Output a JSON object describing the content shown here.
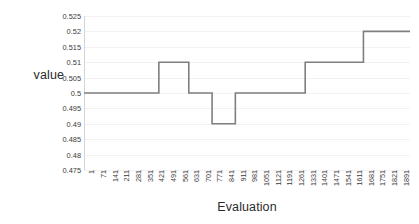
{
  "chart_data": {
    "type": "line",
    "subtype": "step",
    "title": "",
    "xlabel": "Evaluation",
    "ylabel": "value",
    "ylim": [
      0.475,
      0.525
    ],
    "xlim": [
      1,
      1961
    ],
    "grid": true,
    "legend": false,
    "y_ticks": [
      0.525,
      0.52,
      0.515,
      0.51,
      0.505,
      0.5,
      0.495,
      0.49,
      0.485,
      0.48,
      0.475
    ],
    "y_tick_labels": [
      "0.525",
      "0.52",
      "0.515",
      "0.51",
      "0.505",
      "0.5",
      "0.495",
      "0.49",
      "0.485",
      "0.48",
      "0.475"
    ],
    "x_ticks": [
      1,
      71,
      141,
      211,
      281,
      351,
      421,
      491,
      561,
      631,
      701,
      771,
      841,
      911,
      981,
      1051,
      1121,
      1191,
      1261,
      1331,
      1401,
      1471,
      1541,
      1611,
      1681,
      1751,
      1821,
      1891
    ],
    "x_tick_labels": [
      "1",
      "71",
      "141",
      "211",
      "281",
      "351",
      "421",
      "491",
      "561",
      "631",
      "701",
      "771",
      "841",
      "911",
      "981",
      "1051",
      "1121",
      "1191",
      "1261",
      "1331",
      "1401",
      "1471",
      "1541",
      "1611",
      "1681",
      "1751",
      "1821",
      "1891"
    ],
    "line_color": "#7f7f7f",
    "line_width": 1.6,
    "steps": [
      {
        "x_start": 1,
        "x_end": 451,
        "y": 0.5
      },
      {
        "x_start": 451,
        "x_end": 631,
        "y": 0.51
      },
      {
        "x_start": 631,
        "x_end": 771,
        "y": 0.5
      },
      {
        "x_start": 771,
        "x_end": 911,
        "y": 0.49
      },
      {
        "x_start": 911,
        "x_end": 1331,
        "y": 0.5
      },
      {
        "x_start": 1331,
        "x_end": 1681,
        "y": 0.51
      },
      {
        "x_start": 1681,
        "x_end": 1961,
        "y": 0.52
      }
    ],
    "x": [
      1,
      451,
      451,
      631,
      631,
      771,
      771,
      911,
      911,
      1331,
      1331,
      1681,
      1681,
      1961
    ],
    "values": [
      0.5,
      0.5,
      0.51,
      0.51,
      0.5,
      0.5,
      0.49,
      0.49,
      0.5,
      0.5,
      0.51,
      0.51,
      0.52,
      0.52
    ]
  }
}
